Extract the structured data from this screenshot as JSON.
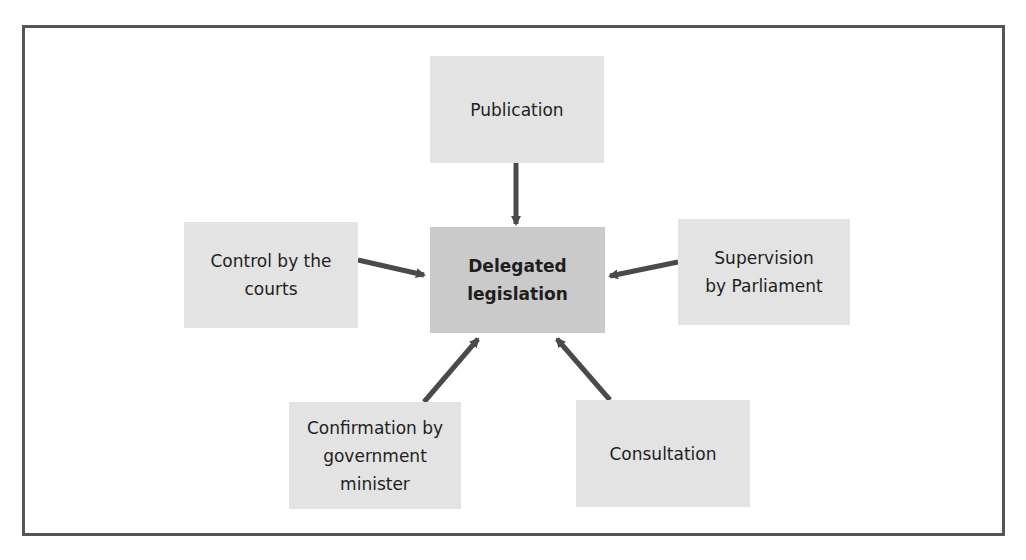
{
  "diagram": {
    "border_color": "#555555",
    "arrow_color": "#4a4a4a",
    "center": {
      "label": "Delegated\nlegislation",
      "fill": "#cacaca"
    },
    "nodes": [
      {
        "id": "publication",
        "label": "Publication",
        "fill": "#e3e3e3"
      },
      {
        "id": "control-courts",
        "label": "Control by the\ncourts",
        "fill": "#e3e3e3"
      },
      {
        "id": "supervision-parliament",
        "label": "Supervision\nby Parliament",
        "fill": "#e3e3e3"
      },
      {
        "id": "confirmation-minister",
        "label": "Confirmation by\ngovernment\nminister",
        "fill": "#e3e3e3"
      },
      {
        "id": "consultation",
        "label": "Consultation",
        "fill": "#e3e3e3"
      }
    ],
    "edges": [
      {
        "from": "publication",
        "to": "center"
      },
      {
        "from": "control-courts",
        "to": "center"
      },
      {
        "from": "supervision-parliament",
        "to": "center"
      },
      {
        "from": "confirmation-minister",
        "to": "center"
      },
      {
        "from": "consultation",
        "to": "center"
      }
    ]
  }
}
